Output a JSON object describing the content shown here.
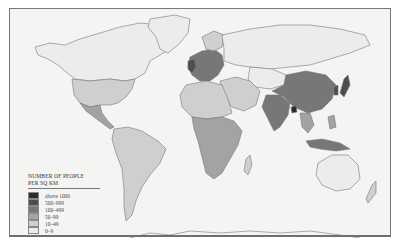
{
  "map": {
    "subject": "World population density",
    "legend": {
      "title_line1": "NUMBER OF PEOPLE",
      "title_line2": "PER SQ KM",
      "classes": [
        {
          "label": "above 1000",
          "color": "#2b2b2b"
        },
        {
          "label": "500–999",
          "color": "#4e4e4e"
        },
        {
          "label": "100–499",
          "color": "#777777"
        },
        {
          "label": "50–99",
          "color": "#a3a3a3"
        },
        {
          "label": "10–49",
          "color": "#cfcfcf"
        },
        {
          "label": "0–9",
          "color": "#ececec"
        }
      ]
    },
    "colors": {
      "background": "#f4f4f3",
      "frame_border": "#7a7a7a",
      "ocean": "#f4f4f3"
    }
  }
}
